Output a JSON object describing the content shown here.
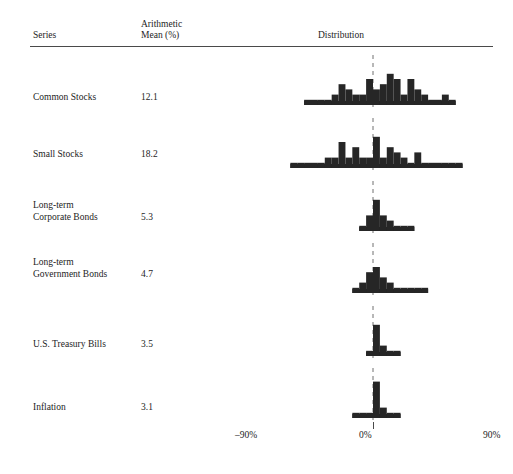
{
  "header": {
    "series_label": "Series",
    "mean_label": "Arithmetic\nMean (%)",
    "distribution_label": "Distribution"
  },
  "axis": {
    "ticks": [
      {
        "label": "–90%",
        "value": -90
      },
      {
        "label": "0%",
        "value": 0
      },
      {
        "label": "90%",
        "value": 90
      }
    ],
    "xmin": -100,
    "xmax": 100,
    "zero_line_style": "dashed"
  },
  "colors": {
    "bar_fill": "#262626",
    "rule": "#4a4a4a",
    "text": "#1d1d1d",
    "zero_line": "#707070"
  },
  "chart_data": {
    "type": "bar",
    "title": "",
    "subtitle": "",
    "xlabel": "Distribution",
    "ylabel": "",
    "xlim": [
      -100,
      100
    ],
    "grid": false,
    "legend": "none",
    "bin_width": 5,
    "note": "Histograms of annual total returns, one panel per asset series. Each bar is a 5% return bin; height = number of years.",
    "series": [
      {
        "name": "Common Stocks",
        "arithmetic_mean": "12.1",
        "mean_value": 12.1,
        "bins": [
          {
            "x": -50,
            "count": 1
          },
          {
            "x": -45,
            "count": 1
          },
          {
            "x": -40,
            "count": 1
          },
          {
            "x": -35,
            "count": 1
          },
          {
            "x": -30,
            "count": 2
          },
          {
            "x": -25,
            "count": 4
          },
          {
            "x": -20,
            "count": 3
          },
          {
            "x": -15,
            "count": 2
          },
          {
            "x": -10,
            "count": 2
          },
          {
            "x": -5,
            "count": 5
          },
          {
            "x": 0,
            "count": 3
          },
          {
            "x": 5,
            "count": 4
          },
          {
            "x": 10,
            "count": 6
          },
          {
            "x": 15,
            "count": 5
          },
          {
            "x": 20,
            "count": 2
          },
          {
            "x": 25,
            "count": 5
          },
          {
            "x": 30,
            "count": 3
          },
          {
            "x": 35,
            "count": 2
          },
          {
            "x": 40,
            "count": 1
          },
          {
            "x": 45,
            "count": 1
          },
          {
            "x": 50,
            "count": 2
          },
          {
            "x": 55,
            "count": 1
          }
        ]
      },
      {
        "name": "Small Stocks",
        "arithmetic_mean": "18.2",
        "mean_value": 18.2,
        "bins": [
          {
            "x": -60,
            "count": 1
          },
          {
            "x": -55,
            "count": 1
          },
          {
            "x": -50,
            "count": 1
          },
          {
            "x": -45,
            "count": 1
          },
          {
            "x": -40,
            "count": 1
          },
          {
            "x": -35,
            "count": 2
          },
          {
            "x": -30,
            "count": 2
          },
          {
            "x": -25,
            "count": 5
          },
          {
            "x": -20,
            "count": 2
          },
          {
            "x": -15,
            "count": 4
          },
          {
            "x": -10,
            "count": 2
          },
          {
            "x": -5,
            "count": 2
          },
          {
            "x": 0,
            "count": 6
          },
          {
            "x": 5,
            "count": 2
          },
          {
            "x": 10,
            "count": 4
          },
          {
            "x": 15,
            "count": 3
          },
          {
            "x": 20,
            "count": 2
          },
          {
            "x": 25,
            "count": 1
          },
          {
            "x": 30,
            "count": 3
          },
          {
            "x": 35,
            "count": 1
          },
          {
            "x": 40,
            "count": 1
          },
          {
            "x": 45,
            "count": 1
          },
          {
            "x": 50,
            "count": 1
          },
          {
            "x": 55,
            "count": 1
          },
          {
            "x": 60,
            "count": 1
          }
        ]
      },
      {
        "name": "Long-term\nCorporate Bonds",
        "arithmetic_mean": "5.3",
        "mean_value": 5.3,
        "bins": [
          {
            "x": -10,
            "count": 1
          },
          {
            "x": -5,
            "count": 3
          },
          {
            "x": 0,
            "count": 6
          },
          {
            "x": 5,
            "count": 3
          },
          {
            "x": 10,
            "count": 2
          },
          {
            "x": 15,
            "count": 1
          },
          {
            "x": 20,
            "count": 1
          },
          {
            "x": 25,
            "count": 1
          }
        ]
      },
      {
        "name": "Long-term\nGovernment Bonds",
        "arithmetic_mean": "4.7",
        "mean_value": 4.7,
        "bins": [
          {
            "x": -15,
            "count": 1
          },
          {
            "x": -10,
            "count": 2
          },
          {
            "x": -5,
            "count": 4
          },
          {
            "x": 0,
            "count": 5
          },
          {
            "x": 5,
            "count": 3
          },
          {
            "x": 10,
            "count": 2
          },
          {
            "x": 15,
            "count": 1
          },
          {
            "x": 20,
            "count": 1
          },
          {
            "x": 25,
            "count": 1
          },
          {
            "x": 30,
            "count": 1
          },
          {
            "x": 35,
            "count": 1
          }
        ]
      },
      {
        "name": "U.S. Treasury Bills",
        "arithmetic_mean": "3.5",
        "mean_value": 3.5,
        "bins": [
          {
            "x": -5,
            "count": 1
          },
          {
            "x": 0,
            "count": 6
          },
          {
            "x": 5,
            "count": 2
          },
          {
            "x": 10,
            "count": 1
          },
          {
            "x": 15,
            "count": 1
          }
        ]
      },
      {
        "name": "Inflation",
        "arithmetic_mean": "3.1",
        "mean_value": 3.1,
        "bins": [
          {
            "x": -15,
            "count": 1
          },
          {
            "x": -10,
            "count": 1
          },
          {
            "x": -5,
            "count": 1
          },
          {
            "x": 0,
            "count": 7
          },
          {
            "x": 5,
            "count": 2
          },
          {
            "x": 10,
            "count": 1
          },
          {
            "x": 15,
            "count": 1
          }
        ]
      }
    ]
  }
}
